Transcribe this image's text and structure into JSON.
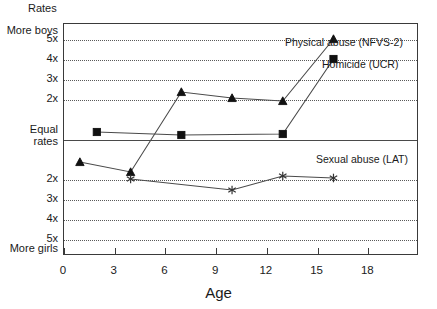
{
  "chart_data": {
    "type": "line",
    "title": "",
    "ylabel": "Rates",
    "xlabel": "Age",
    "x_ticks": [
      0,
      3,
      6,
      9,
      12,
      15,
      18
    ],
    "xlim": [
      0,
      21
    ],
    "y_tick_labels_top_to_bottom": [
      "More boys",
      "5x",
      "4x",
      "3x",
      "2x",
      "Equal rates",
      "2x",
      "3x",
      "4x",
      "5x",
      "More girls"
    ],
    "y_axis_top_label": "More boys",
    "y_axis_bottom_label": "More girls",
    "y_axis_center_label_line1": "Equal",
    "y_axis_center_label_line2": "rates",
    "ylim": [
      -5.8,
      5.8
    ],
    "grid": true,
    "gridlines_at": [
      5,
      4,
      3,
      2,
      -2,
      -3,
      -4,
      -5
    ],
    "zero_line_at": 0,
    "legend_position": "inline-right",
    "series": [
      {
        "name": "Physical abuse (NFVS-2)",
        "marker": "triangle",
        "label_x": 285,
        "label_y": 36,
        "x": [
          1,
          4,
          7,
          10,
          13,
          16
        ],
        "y": [
          -1.15,
          -1.65,
          2.35,
          2.05,
          1.9,
          5.0
        ]
      },
      {
        "name": "Homicide (UCR)",
        "marker": "square",
        "label_x": 322,
        "label_y": 58,
        "x": [
          2,
          7,
          13,
          16
        ],
        "y": [
          0.35,
          0.2,
          0.25,
          4.0
        ]
      },
      {
        "name": "Sexual abuse (LAT)",
        "marker": "asterisk",
        "label_x": 316,
        "label_y": 153,
        "x": [
          4,
          10,
          13,
          16
        ],
        "y": [
          -2.0,
          -2.55,
          -1.85,
          -1.95
        ]
      }
    ]
  },
  "colors": {
    "frame": "#3a3a3a",
    "grid": "#5a5a5a",
    "line": "#4a4a4a",
    "marker": "#111111",
    "background": "#ffffff"
  }
}
